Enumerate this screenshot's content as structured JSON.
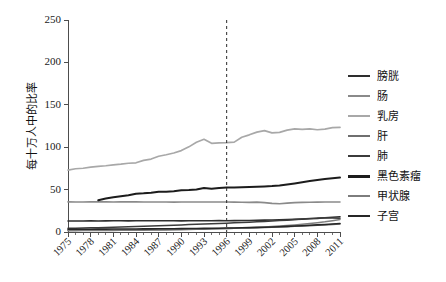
{
  "chart_data": {
    "type": "line",
    "title": "",
    "xlabel": "",
    "ylabel": "每十万人中的比率",
    "xlim": [
      1975,
      2011
    ],
    "ylim": [
      0,
      250
    ],
    "yticks": [
      0,
      50,
      100,
      150,
      200,
      250
    ],
    "xticks": [
      1975,
      1978,
      1981,
      1984,
      1987,
      1990,
      1993,
      1996,
      1999,
      2002,
      2005,
      2008,
      2011
    ],
    "grid": false,
    "legend_position": "right",
    "annotations": [
      {
        "type": "vline",
        "x": 1996,
        "style": "dashed",
        "color": "#2b2b2b"
      }
    ],
    "x": [
      1975,
      1976,
      1977,
      1978,
      1979,
      1980,
      1981,
      1982,
      1983,
      1984,
      1985,
      1986,
      1987,
      1988,
      1989,
      1990,
      1991,
      1992,
      1993,
      1994,
      1995,
      1996,
      1997,
      1998,
      1999,
      2000,
      2001,
      2002,
      2003,
      2004,
      2005,
      2006,
      2007,
      2008,
      2009,
      2010,
      2011
    ],
    "series": [
      {
        "name": "膀胱",
        "color": "#2e2e2e",
        "width": 1.6,
        "values": [
          12.9,
          12.9,
          13.0,
          13.1,
          13.0,
          13.1,
          13.2,
          13.2,
          13.1,
          13.2,
          13.3,
          13.2,
          13.3,
          13.3,
          13.2,
          13.1,
          13.2,
          13.3,
          13.2,
          13.3,
          13.4,
          13.3,
          13.4,
          13.5,
          13.6,
          13.8,
          14.0,
          14.2,
          14.4,
          14.6,
          14.9,
          15.2,
          15.6,
          16.0,
          16.8,
          17.4,
          17.9
        ]
      },
      {
        "name": "肠",
        "color": "#8a8a8a",
        "width": 1.6,
        "values": [
          35.5,
          35.4,
          35.4,
          35.5,
          35.6,
          35.5,
          35.4,
          35.5,
          35.6,
          35.5,
          35.4,
          35.3,
          35.4,
          35.3,
          35.2,
          35.3,
          35.4,
          35.3,
          35.4,
          35.3,
          35.4,
          35.3,
          35.2,
          35.1,
          34.9,
          35.2,
          34.6,
          33.8,
          33.4,
          34.0,
          34.6,
          34.9,
          35.0,
          35.2,
          35.3,
          35.4,
          35.4
        ]
      },
      {
        "name": "乳房",
        "color": "#a8a8a8",
        "width": 1.7,
        "values": [
          73.0,
          74.6,
          75.2,
          76.4,
          77.3,
          78.1,
          79.1,
          80.0,
          81.1,
          81.6,
          84.5,
          86.0,
          89.3,
          91.1,
          93.2,
          96.0,
          100.4,
          105.8,
          109.4,
          104.6,
          105.1,
          105.3,
          106.0,
          111.8,
          114.6,
          117.8,
          119.6,
          116.9,
          117.5,
          120.1,
          121.6,
          121.0,
          121.5,
          120.6,
          121.4,
          123.0,
          123.4
        ]
      },
      {
        "name": "肝",
        "color": "#6f6f6f",
        "width": 1.5,
        "values": [
          2.0,
          2.0,
          2.1,
          2.1,
          2.2,
          2.2,
          2.3,
          2.3,
          2.4,
          2.5,
          2.6,
          2.7,
          2.8,
          2.9,
          3.0,
          3.1,
          3.3,
          3.4,
          3.6,
          3.8,
          4.0,
          4.2,
          4.4,
          4.6,
          4.9,
          5.1,
          5.4,
          5.7,
          6.0,
          6.3,
          6.7,
          7.1,
          7.5,
          7.9,
          8.4,
          8.9,
          9.4
        ]
      },
      {
        "name": "肺",
        "color": "#3b3b3b",
        "width": 1.5,
        "values": [
          4.3,
          4.5,
          4.7,
          4.9,
          5.1,
          5.4,
          5.6,
          5.9,
          6.2,
          6.5,
          6.8,
          7.1,
          7.4,
          7.7,
          8.0,
          8.4,
          8.8,
          9.2,
          9.5,
          9.8,
          10.1,
          10.4,
          10.8,
          11.2,
          11.6,
          12.1,
          12.5,
          13.0,
          13.5,
          14.0,
          14.6,
          15.2,
          15.8,
          16.4,
          16.7,
          16.5,
          16.3
        ]
      },
      {
        "name": "黑色素瘤",
        "color": "#1c1c1c",
        "width": 2.0,
        "values": [
          null,
          null,
          null,
          null,
          37.5,
          39.5,
          41.0,
          42.2,
          43.4,
          45.2,
          45.6,
          46.3,
          47.6,
          47.5,
          48.1,
          49.1,
          49.5,
          50.2,
          51.8,
          51.0,
          51.8,
          52.5,
          52.6,
          52.9,
          53.2,
          53.5,
          53.8,
          54.1,
          54.7,
          56.0,
          57.3,
          58.7,
          60.1,
          61.4,
          62.4,
          63.3,
          64.2
        ]
      },
      {
        "name": "甲状腺",
        "color": "#7d7d7d",
        "width": 1.5,
        "values": [
          1.6,
          1.6,
          1.7,
          1.7,
          1.8,
          1.8,
          1.9,
          2.0,
          2.0,
          2.1,
          2.2,
          2.3,
          2.4,
          2.5,
          2.6,
          2.8,
          2.9,
          3.1,
          3.3,
          3.5,
          3.7,
          4.0,
          4.3,
          4.6,
          5.0,
          5.4,
          5.9,
          6.4,
          7.0,
          7.6,
          8.3,
          9.1,
          10.0,
          11.0,
          12.1,
          13.4,
          14.8
        ]
      },
      {
        "name": "子宫",
        "color": "#262626",
        "width": 1.6,
        "values": [
          3.2,
          3.2,
          3.3,
          3.3,
          3.4,
          3.4,
          3.5,
          3.5,
          3.6,
          3.6,
          3.7,
          3.7,
          3.8,
          3.8,
          3.9,
          4.0,
          4.1,
          4.2,
          4.3,
          4.4,
          4.5,
          4.7,
          4.8,
          5.0,
          5.2,
          5.4,
          5.6,
          5.9,
          6.2,
          6.6,
          7.0,
          7.4,
          7.9,
          8.4,
          8.9,
          9.5,
          10.1
        ]
      }
    ]
  },
  "legend": {
    "items": [
      {
        "label": "膀胱",
        "color": "#2e2e2e",
        "width": 2.6
      },
      {
        "label": "肠",
        "color": "#8a8a8a",
        "width": 2.2
      },
      {
        "label": "乳房",
        "color": "#a8a8a8",
        "width": 2.4
      },
      {
        "label": "肝",
        "color": "#6f6f6f",
        "width": 2.2
      },
      {
        "label": "肺",
        "color": "#3b3b3b",
        "width": 2.3
      },
      {
        "label": "黑色素瘤",
        "color": "#1c1c1c",
        "width": 3.0
      },
      {
        "label": "甲状腺",
        "color": "#7d7d7d",
        "width": 2.2
      },
      {
        "label": "子宫",
        "color": "#262626",
        "width": 2.6
      }
    ]
  },
  "axes": {
    "y_label": "每十万人中的比率",
    "y_tick_labels": [
      "0",
      "50",
      "100",
      "150",
      "200",
      "250"
    ],
    "x_tick_labels": [
      "1975",
      "1978",
      "1981",
      "1984",
      "1987",
      "1990",
      "1993",
      "1996",
      "1999",
      "2002",
      "2005",
      "2008",
      "2011"
    ]
  }
}
